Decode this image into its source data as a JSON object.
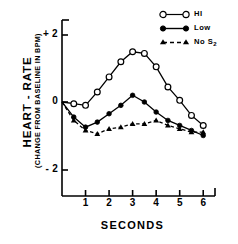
{
  "chart_data": {
    "type": "line",
    "title": "",
    "xlabel": "SECONDS",
    "ylabel": "HEART - RATE",
    "ylabel_sub": "(CHANGE FROM BASELINE IN BPM)",
    "xlim": [
      0,
      6.5
    ],
    "ylim": [
      -2.6,
      2.6
    ],
    "xticks": [
      1,
      2,
      3,
      4,
      5,
      6
    ],
    "xtick_labels": [
      "1",
      "2",
      "3",
      "4",
      "5",
      "6"
    ],
    "yticks": [
      2,
      0,
      -2
    ],
    "ytick_labels": [
      "+ 2",
      "0",
      "- 2"
    ],
    "grid": false,
    "legend_position": "top-right",
    "x": [
      0,
      0.5,
      1,
      1.5,
      2,
      2.5,
      3,
      3.5,
      4,
      4.5,
      5,
      5.5,
      6
    ],
    "series": [
      {
        "name": "HI",
        "marker": "open-circle",
        "line": "solid",
        "color": "#000000",
        "values": [
          0,
          -0.05,
          -0.1,
          0.3,
          0.75,
          1.2,
          1.5,
          1.45,
          1.05,
          0.45,
          0.05,
          -0.4,
          -0.7
        ]
      },
      {
        "name": "Low",
        "marker": "filled-circle",
        "line": "solid",
        "color": "#000000",
        "values": [
          0,
          -0.45,
          -0.75,
          -0.6,
          -0.35,
          -0.1,
          0.2,
          0.0,
          -0.3,
          -0.55,
          -0.7,
          -0.85,
          -1.0
        ]
      },
      {
        "name": "No S2",
        "marker": "filled-triangle",
        "line": "dashed",
        "color": "#000000",
        "values": [
          0,
          -0.55,
          -0.85,
          -0.95,
          -0.8,
          -0.75,
          -0.65,
          -0.65,
          -0.55,
          -0.7,
          -0.8,
          -0.9,
          -0.9
        ]
      }
    ]
  },
  "legend": {
    "items": [
      {
        "label": "HI",
        "sub": ""
      },
      {
        "label": "Low",
        "sub": ""
      },
      {
        "label": "No S",
        "sub": "2"
      }
    ]
  },
  "axis": {
    "y_title": "HEART - RATE",
    "y_subtitle": "(CHANGE FROM BASELINE IN BPM)",
    "x_title": "SECONDS",
    "y_tick_top": "+ 2",
    "y_tick_mid": "0",
    "y_tick_bot": "- 2"
  }
}
